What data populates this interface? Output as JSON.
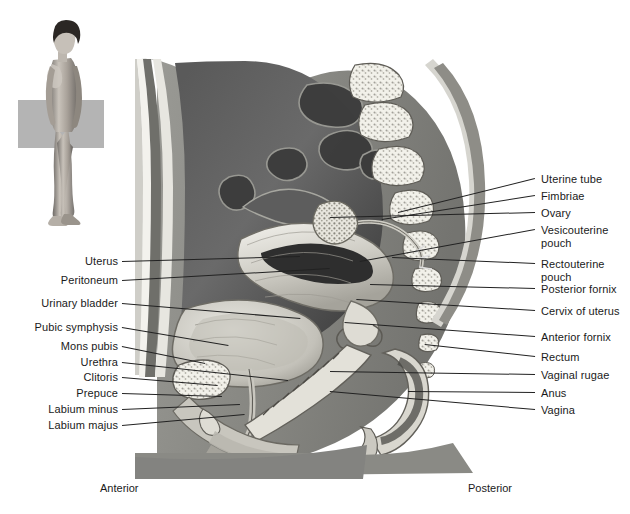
{
  "figure": {
    "orientation_figure": {
      "name": "standing-female-figure",
      "plane_marker_color": "#b4b4b4"
    },
    "direction_labels": {
      "anterior": "Anterior",
      "posterior": "Posterior"
    },
    "labels_left": [
      {
        "text": "Uterus",
        "y": 261,
        "tip_x": 300,
        "tip_y": 256
      },
      {
        "text": "Peritoneum",
        "y": 280,
        "tip_x": 330,
        "tip_y": 268
      },
      {
        "text": "Urinary bladder",
        "y": 303,
        "tip_x": 300,
        "tip_y": 318
      },
      {
        "text": "Pubic symphysis",
        "y": 327,
        "tip_x": 228,
        "tip_y": 345
      },
      {
        "text": "Mons pubis",
        "y": 346,
        "tip_x": 205,
        "tip_y": 363
      },
      {
        "text": "Urethra",
        "y": 362,
        "tip_x": 288,
        "tip_y": 380
      },
      {
        "text": "Clitoris",
        "y": 377,
        "tip_x": 218,
        "tip_y": 385
      },
      {
        "text": "Prepuce",
        "y": 393,
        "tip_x": 222,
        "tip_y": 396
      },
      {
        "text": "Labium minus",
        "y": 409,
        "tip_x": 240,
        "tip_y": 404
      },
      {
        "text": "Labium majus",
        "y": 425,
        "tip_x": 245,
        "tip_y": 414
      }
    ],
    "labels_right": [
      {
        "text": "Uterine tube",
        "line2": "",
        "y": 179,
        "tip_x": 398,
        "tip_y": 213
      },
      {
        "text": "Fimbriae",
        "line2": "",
        "y": 196,
        "tip_x": 382,
        "tip_y": 220
      },
      {
        "text": "Ovary",
        "line2": "",
        "y": 213,
        "tip_x": 330,
        "tip_y": 218
      },
      {
        "text": "Vesicouterine",
        "line2": "pouch",
        "y": 230,
        "tip_x": 360,
        "tip_y": 262
      },
      {
        "text": "Rectouterine",
        "line2": "pouch",
        "y": 264,
        "tip_x": 392,
        "tip_y": 258
      },
      {
        "text": "Posterior fornix",
        "line2": "",
        "y": 289,
        "tip_x": 370,
        "tip_y": 285
      },
      {
        "text": "Cervix of uterus",
        "line2": "",
        "y": 311,
        "tip_x": 356,
        "tip_y": 300
      },
      {
        "text": "Anterior fornix",
        "line2": "",
        "y": 337,
        "tip_x": 345,
        "tip_y": 323
      },
      {
        "text": "Rectum",
        "line2": "",
        "y": 357,
        "tip_x": 425,
        "tip_y": 345
      },
      {
        "text": "Vaginal rugae",
        "line2": "",
        "y": 375,
        "tip_x": 330,
        "tip_y": 372
      },
      {
        "text": "Anus",
        "line2": "",
        "y": 393,
        "tip_x": 408,
        "tip_y": 392
      },
      {
        "text": "Vagina",
        "line2": "",
        "y": 410,
        "tip_x": 330,
        "tip_y": 392
      }
    ],
    "colors": {
      "background": "#ffffff",
      "leader_line": "#222222",
      "text": "#1a1a1a",
      "cavity_dark": "#4a4a4a",
      "tissue_light": "#d8d8d4",
      "bone": "#efefe9",
      "body_gray": "#8d8d8d"
    }
  }
}
